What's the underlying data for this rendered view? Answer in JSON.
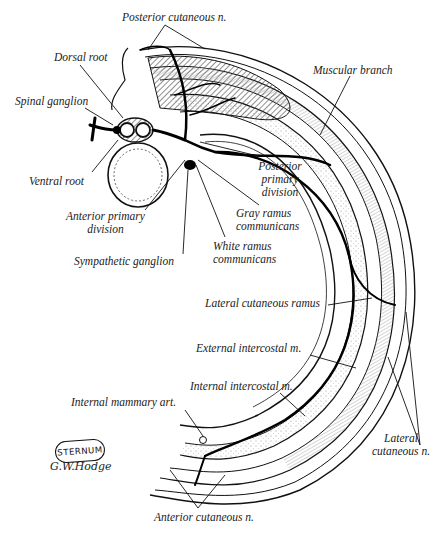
{
  "figure": {
    "labels": {
      "posterior_cutaneous": "Posterior cutaneous n.",
      "dorsal_root": "Dorsal root",
      "muscular_branch": "Muscular branch",
      "spinal_ganglion": "Spinal ganglion",
      "ventral_root": "Ventral root",
      "posterior_primary_1": "Posterior",
      "posterior_primary_2": "primary",
      "posterior_primary_3": "division",
      "anterior_primary_1": "Anterior primary",
      "anterior_primary_2": "division",
      "gray_ramus_1": "Gray ramus",
      "gray_ramus_2": "communicans",
      "white_ramus_1": "White ramus",
      "white_ramus_2": "communicans",
      "sympathetic_ganglion": "Sympathetic ganglion",
      "lateral_cutaneous_ramus": "Lateral cutaneous ramus",
      "external_intercostal": "External intercostal m.",
      "internal_intercostal": "Internal intercostal m.",
      "internal_mammary": "Internal mammary art.",
      "lateral_cutaneous_1": "Lateral",
      "lateral_cutaneous_2": "cutaneous n.",
      "anterior_cutaneous": "Anterior cutaneous n.",
      "sternum": "STERNUM",
      "signature": "G.W.Hodge"
    },
    "colors": {
      "ink": "#111111",
      "hatch": "#555555",
      "background": "#ffffff"
    }
  }
}
